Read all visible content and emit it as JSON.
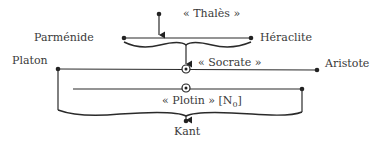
{
  "diagram": {
    "nodes": {
      "thales": "« Thalès »",
      "parmenide": "Parménide",
      "heraclite": "Héraclite",
      "platon": "Platon",
      "socrate": "« Socrate »",
      "aristote": "Aristote",
      "plotin": "« Plotin » [N",
      "plotin_sub": "0",
      "plotin_close": "]",
      "kant": "Kant"
    },
    "edges": [
      {
        "from": "Thalès",
        "to": "Parménide–Héraclite line"
      },
      {
        "from": "Parménide–Héraclite",
        "to": "Socrate"
      },
      {
        "from": "Platon–Aristote & Plotin",
        "to": "Kant"
      }
    ]
  }
}
